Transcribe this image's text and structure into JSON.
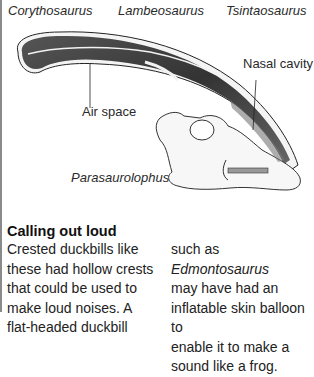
{
  "header_species": [
    {
      "name": "Corythosaurus"
    },
    {
      "name": "Lambeosaurus"
    },
    {
      "name": "Tsintaosaurus"
    }
  ],
  "illustration": {
    "subject": "Parasaurolophus skull cross-section",
    "labels": {
      "nasal_cavity": "Nasal cavity",
      "air_space": "Air space",
      "species": "Parasaurolophus"
    }
  },
  "article": {
    "heading": "Calling out loud",
    "col1_lines": [
      "Crested duckbills like",
      "these had hollow crests",
      "that could be used to",
      "make loud noises. A",
      "flat-headed duckbill"
    ],
    "col2_line1_prefix": "such as ",
    "col2_line1_italic": "Edmontosaurus",
    "col2_lines": [
      "may have had an",
      "inflatable skin balloon to",
      "enable it to make a",
      "sound like a frog."
    ]
  },
  "colors": {
    "rule": "#8a8a8a",
    "crest_dark": "#3a3a3a",
    "text": "#222222"
  }
}
